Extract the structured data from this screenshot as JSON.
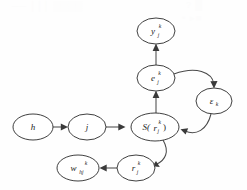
{
  "figure": {
    "type": "directed-graph",
    "width": 247,
    "height": 190,
    "background_color": "#fefefe",
    "node_stroke_color": "#2a2a2a",
    "edge_color": "#4a4a4a",
    "label_color": "#1c1c1c"
  },
  "nodes": [
    {
      "id": "y",
      "name": "node-y",
      "label": "y",
      "subscript": "j",
      "superscript": "k",
      "cx": 156,
      "cy": 31,
      "rx": 19,
      "ry": 13
    },
    {
      "id": "e",
      "name": "node-e",
      "label": "e",
      "subscript": "j",
      "superscript": "k",
      "cx": 156,
      "cy": 78,
      "rx": 19,
      "ry": 13
    },
    {
      "id": "eps",
      "name": "node-epsilon",
      "label": "ε",
      "subscript": "k",
      "superscript": "",
      "cx": 214,
      "cy": 101,
      "rx": 18,
      "ry": 13
    },
    {
      "id": "s",
      "name": "node-s-of-r",
      "label": "S(",
      "subscript": "",
      "superscript": "",
      "inner_label": "r",
      "inner_subscript": "j",
      "inner_superscript": "k",
      "closing": ")",
      "cx": 155,
      "cy": 127,
      "rx": 24,
      "ry": 14
    },
    {
      "id": "j",
      "name": "node-j",
      "label": "j",
      "subscript": "",
      "superscript": "",
      "cx": 87,
      "cy": 127,
      "rx": 19,
      "ry": 13
    },
    {
      "id": "h",
      "name": "node-h",
      "label": "h",
      "subscript": "",
      "superscript": "",
      "cx": 33,
      "cy": 127,
      "rx": 20,
      "ry": 13
    },
    {
      "id": "r",
      "name": "node-r",
      "label": "r",
      "subscript": "j",
      "superscript": "k",
      "cx": 136,
      "cy": 168,
      "rx": 19,
      "ry": 13
    },
    {
      "id": "w",
      "name": "node-w",
      "label": "w",
      "subscript": "hj",
      "superscript": "k",
      "cx": 78,
      "cy": 168,
      "rx": 21,
      "ry": 13
    }
  ],
  "edges": [
    {
      "name": "edge-e-to-y",
      "from": "e",
      "to": "y",
      "style": "straight-vertical"
    },
    {
      "name": "edge-s-to-e",
      "from": "s",
      "to": "e",
      "style": "straight-vertical"
    },
    {
      "name": "edge-e-to-eps",
      "from": "e",
      "to": "eps",
      "style": "curve-right-down"
    },
    {
      "name": "edge-eps-to-s",
      "from": "eps",
      "to": "s",
      "style": "curve-down-left"
    },
    {
      "name": "edge-h-to-j",
      "from": "h",
      "to": "j",
      "style": "straight-horizontal"
    },
    {
      "name": "edge-j-to-s",
      "from": "j",
      "to": "s",
      "style": "straight-horizontal"
    },
    {
      "name": "edge-s-to-r",
      "from": "s",
      "to": "r",
      "style": "curve-down-left"
    },
    {
      "name": "edge-r-to-w",
      "from": "r",
      "to": "w",
      "style": "straight-horizontal"
    }
  ],
  "ghost_artifacts": [
    {
      "name": "ghost-top-left",
      "text": "── │││ ▒▒▒▒",
      "x": 12,
      "y": 2
    },
    {
      "name": "ghost-top-right",
      "text": "?  █",
      "x": 186,
      "y": 1
    },
    {
      "name": "ghost-mid-right",
      "text": "• ▸■",
      "x": 182,
      "y": 13
    }
  ]
}
